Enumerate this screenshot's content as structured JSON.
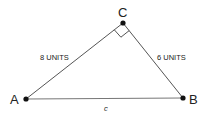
{
  "diagram": {
    "type": "right-triangle",
    "vertices": {
      "A": {
        "label": "A",
        "x": 26,
        "y": 99
      },
      "B": {
        "label": "B",
        "x": 183,
        "y": 98
      },
      "C": {
        "label": "C",
        "x": 123,
        "y": 23
      }
    },
    "right_angle_at": "C",
    "sides": {
      "AC": {
        "label": "8 UNITS"
      },
      "CB": {
        "label": "6 UNITS"
      },
      "AB": {
        "label": "c"
      }
    },
    "colors": {
      "line": "#555555",
      "point": "#111111",
      "text": "#222222"
    }
  }
}
